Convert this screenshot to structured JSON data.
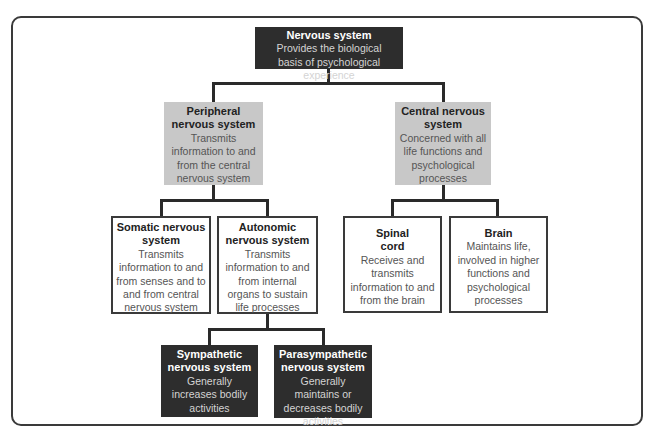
{
  "diagram": {
    "type": "hierarchy",
    "nodes": {
      "nervous": {
        "title": "Nervous system",
        "description": "Provides the biological basis of psychological experience"
      },
      "peripheral": {
        "title": "Peripheral nervous system",
        "description": "Transmits information to and from the central nervous system"
      },
      "central": {
        "title": "Central nervous system",
        "description": "Concerned with all life functions and psychological processes"
      },
      "somatic": {
        "title": "Somatic nervous system",
        "description": "Transmits information to and from senses and to and from central nervous system"
      },
      "autonomic": {
        "title": "Autonomic nervous system",
        "description": "Transmits information to and from internal organs to sustain life processes"
      },
      "spinal": {
        "title": "Spinal cord",
        "description": "Receives and transmits information to and from the brain"
      },
      "brain": {
        "title": "Brain",
        "description": "Maintains life, involved in higher functions and psychological processes"
      },
      "sympathetic": {
        "title": "Sympathetic nervous system",
        "description": "Generally increases bodily activities"
      },
      "parasympathetic": {
        "title": "Parasympathetic nervous system",
        "description": "Generally maintains or decreases bodily activities"
      }
    },
    "edges": [
      [
        "nervous",
        "peripheral"
      ],
      [
        "nervous",
        "central"
      ],
      [
        "peripheral",
        "somatic"
      ],
      [
        "peripheral",
        "autonomic"
      ],
      [
        "central",
        "spinal"
      ],
      [
        "central",
        "brain"
      ],
      [
        "autonomic",
        "sympathetic"
      ],
      [
        "autonomic",
        "parasympathetic"
      ]
    ],
    "colors": {
      "dark_box": "#2d2d2d",
      "grey_box": "#c8c8c8",
      "white_box": "#ffffff",
      "line": "#2a2a2a"
    }
  }
}
